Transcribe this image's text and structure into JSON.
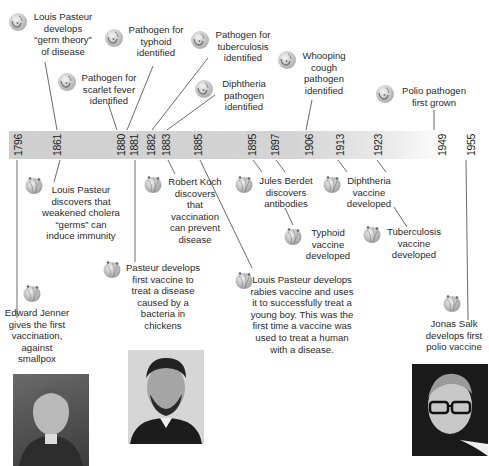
{
  "timeline": {
    "years": [
      "1796",
      "1861",
      "1880",
      "1881",
      "1882",
      "1883",
      "1885",
      "1895",
      "1897",
      "1906",
      "1913",
      "1923",
      "1949",
      "1955"
    ],
    "band_color": "#d0d0d0"
  },
  "events_above": [
    {
      "year": "1861",
      "text": "Louis Pasteur develops “germ theory” of disease",
      "icon": "pathogen-icon"
    },
    {
      "year": "1880",
      "text": "Pathogen for scarlet fever identified",
      "icon": "pathogen-icon"
    },
    {
      "year": "1881",
      "text": "Pathogen for typhoid identified",
      "icon": "pathogen-icon"
    },
    {
      "year": "1882",
      "text": "Pathogen for tuberculosis identified",
      "icon": "pathogen-icon"
    },
    {
      "year": "1883",
      "text": "Diphtheria pathogen identified",
      "icon": "pathogen-icon"
    },
    {
      "year": "1906",
      "text": "Whooping cough pathogen identified",
      "icon": "pathogen-icon"
    },
    {
      "year": "1949",
      "text": "Polio pathogen first grown",
      "icon": "pathogen-icon"
    }
  ],
  "events_below": [
    {
      "year": "1796",
      "text": "Edward Jenner gives the first vaccination, against smallpox",
      "icon": "vaccine-icon"
    },
    {
      "year": "1861",
      "text": "Louis Pasteur discovers that weakened cholera “germs” can induce immunity",
      "icon": "vaccine-icon"
    },
    {
      "year": "1881",
      "text": "Pasteur develops first vaccine to treat a disease caused by a bacteria in chickens",
      "icon": "vaccine-icon"
    },
    {
      "year": "1883",
      "text": "Robert Koch discovers that vaccination can prevent disease",
      "icon": "vaccine-icon"
    },
    {
      "year": "1885",
      "text": "Louis Pasteur develops rabies vaccine and uses it to successfully treat a young boy. This was the first time a vaccine was used to treat a human with a disease.",
      "icon": "vaccine-icon"
    },
    {
      "year": "1895",
      "text": "Jules Berdet discovers antibodies",
      "icon": "vaccine-icon"
    },
    {
      "year": "1897",
      "text": "Typhoid vaccine developed",
      "icon": "vaccine-icon"
    },
    {
      "year": "1913",
      "text": "Diphtheria vaccine developed",
      "icon": "vaccine-icon"
    },
    {
      "year": "1923",
      "text": "Tuberculosis vaccine developed",
      "icon": "vaccine-icon"
    },
    {
      "year": "1955",
      "text": "Jonas Salk develops first polio vaccine",
      "icon": "vaccine-icon"
    }
  ],
  "labels": {
    "a_pasteur_germ": [
      "Louis Pasteur",
      "develops",
      "“germ theory”",
      "of disease"
    ],
    "a_scarlet": [
      "Pathogen for",
      "scarlet fever",
      "identified"
    ],
    "a_typhoid": [
      "Pathogen for",
      "typhoid",
      "identified"
    ],
    "a_tb": [
      "Pathogen for",
      "tuberculosis",
      "identified"
    ],
    "a_diph": [
      "Diphtheria",
      "pathogen",
      "identified"
    ],
    "a_whoop": [
      "Whooping",
      "cough",
      "pathogen",
      "identified"
    ],
    "a_polio": [
      "Polio pathogen",
      "first grown"
    ],
    "b_cholera": [
      "Louis Pasteur",
      "discovers that",
      "weakened cholera",
      "“germs” can",
      "induce immunity"
    ],
    "b_koch": [
      "Robert Koch",
      "discovers",
      "that",
      "vaccination",
      "can prevent",
      "disease"
    ],
    "b_berdet": [
      "Jules Berdet",
      "discovers",
      "antibodies"
    ],
    "b_diphvac": [
      "Diphtheria",
      "vaccine",
      "developed"
    ],
    "b_typhvac": [
      "Typhoid",
      "vaccine",
      "developed"
    ],
    "b_tbvac": [
      "Tuberculosis",
      "vaccine",
      "developed"
    ],
    "b_chicken": [
      "Pasteur develops",
      "first vaccine to",
      "treat a disease",
      "caused by a",
      "bacteria in",
      "chickens"
    ],
    "b_rabies": [
      "Louis Pasteur develops",
      "rabies vaccine and uses",
      "it to successfully treat a",
      "young boy. This was the",
      "first time a vaccine was",
      "used to treat a human",
      "with a disease."
    ],
    "b_jenner": [
      "Edward Jenner",
      "gives the first",
      "vaccination,",
      "against",
      "smallpox"
    ],
    "b_salk": [
      "Jonas Salk",
      "develops first",
      "polio vaccine"
    ]
  },
  "portraits": [
    {
      "name": "Edward Jenner"
    },
    {
      "name": "Louis Pasteur"
    },
    {
      "name": "Jonas Salk"
    }
  ]
}
